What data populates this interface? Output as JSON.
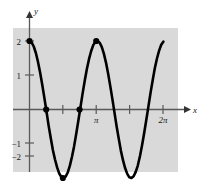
{
  "figure": {
    "title": "",
    "background_color": "#ffffff",
    "panel_color": "#d9d9d9",
    "curve_color": "#000000",
    "axis_color": "#595959",
    "panel": {
      "x": 13,
      "y": 28,
      "width": 165,
      "height": 144
    }
  },
  "labels": {
    "x_axis": "x",
    "y_axis": "y",
    "y_tick_2": "2",
    "y_tick_1": "1",
    "y_tick_neg1": "−1",
    "y_tick_neg2": "−2",
    "x_tick_pi": "π",
    "x_tick_2pi": "2π"
  },
  "chart_data": {
    "type": "line",
    "title": "",
    "xlabel": "x",
    "ylabel": "y",
    "function": "y = 2 cos(2x)",
    "amplitude": 2,
    "period": "π",
    "xlim": [
      -0.25,
      7.1
    ],
    "ylim": [
      -2.45,
      2.45
    ],
    "grid": false,
    "legend": null,
    "x_ticks": [
      {
        "value": 0.7854,
        "label": ""
      },
      {
        "value": 1.5708,
        "label": ""
      },
      {
        "value": 3.1416,
        "label": "π"
      },
      {
        "value": 4.7124,
        "label": ""
      },
      {
        "value": 6.2832,
        "label": "2π"
      }
    ],
    "y_ticks": [
      {
        "value": 2,
        "label": "2"
      },
      {
        "value": 1,
        "label": "1"
      },
      {
        "value": -1,
        "label": "−1"
      },
      {
        "value": -2,
        "label": "−2"
      }
    ],
    "marked_points": [
      {
        "x": 0,
        "y": 2,
        "label": ""
      },
      {
        "x": 0.7854,
        "y": 0,
        "label": ""
      },
      {
        "x": 1.5708,
        "y": -2,
        "label": ""
      },
      {
        "x": 2.3562,
        "y": 0,
        "label": ""
      },
      {
        "x": 3.1416,
        "y": 2,
        "label": ""
      }
    ],
    "x": [
      0.0,
      0.1,
      0.2,
      0.3,
      0.4,
      0.5,
      0.6,
      0.7,
      0.8,
      0.9,
      1.0,
      1.1,
      1.2,
      1.3,
      1.4,
      1.5,
      1.6,
      1.7,
      1.8,
      1.9,
      2.0,
      2.1,
      2.2,
      2.3,
      2.4,
      2.5,
      2.6,
      2.7,
      2.8,
      2.9,
      3.0,
      3.1,
      3.2,
      3.3,
      3.4,
      3.5,
      3.6,
      3.7,
      3.8,
      3.9,
      4.0,
      4.1,
      4.2,
      4.3,
      4.4,
      4.5,
      4.6,
      4.7,
      4.8,
      4.9,
      5.0,
      5.1,
      5.2,
      5.3,
      5.4,
      5.5,
      5.6,
      5.7,
      5.8,
      5.9,
      6.0,
      6.1,
      6.2,
      6.3
    ],
    "values": [
      2.0,
      1.96,
      1.84,
      1.65,
      1.39,
      1.08,
      0.72,
      0.34,
      -0.06,
      -0.47,
      -0.83,
      -1.18,
      -1.46,
      -1.69,
      -1.87,
      -1.97,
      -2.0,
      -1.96,
      -1.84,
      -1.64,
      -1.38,
      -1.07,
      -0.71,
      -0.32,
      0.07,
      0.47,
      0.84,
      1.18,
      1.47,
      1.7,
      1.88,
      1.98,
      2.0,
      1.95,
      1.83,
      1.63,
      1.37,
      1.05,
      0.69,
      0.31,
      -0.09,
      -0.49,
      -0.85,
      -1.2,
      -1.48,
      -1.71,
      -1.88,
      -1.98,
      -2.0,
      -1.95,
      -1.82,
      -1.63,
      -1.36,
      -1.04,
      -0.68,
      -0.29,
      0.1,
      0.5,
      0.86,
      1.21,
      1.49,
      1.72,
      1.89,
      1.98
    ]
  }
}
